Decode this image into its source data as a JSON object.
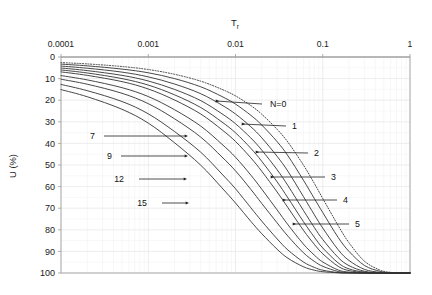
{
  "chart_data": {
    "type": "line",
    "title": "",
    "xlabel": "T_r",
    "xlabel_display": "T",
    "xlabel_sub": "r",
    "ylabel": "U (%)",
    "xscale": "log",
    "xlim": [
      0.0001,
      1
    ],
    "ylim": [
      0,
      100
    ],
    "y_inverted": true,
    "xticks": [
      0.0001,
      0.001,
      0.01,
      0.1,
      1
    ],
    "xticklabels": [
      "0.0001",
      "0.001",
      "0.01",
      "0.1",
      "1"
    ],
    "yticks": [
      0,
      10,
      20,
      30,
      40,
      50,
      60,
      70,
      80,
      90,
      100
    ],
    "yticklabels": [
      "0",
      "10",
      "20",
      "30",
      "40",
      "50",
      "60",
      "70",
      "80",
      "90",
      "100"
    ],
    "grid": true,
    "grid_minor": true,
    "legend": "none",
    "series": [
      {
        "name": "N=0",
        "style": "dotted",
        "x": [
          0.0001,
          0.0002,
          0.0005,
          0.001,
          0.002,
          0.004,
          0.007,
          0.01,
          0.015,
          0.02,
          0.03,
          0.04,
          0.06,
          0.08,
          0.1,
          0.15,
          0.2,
          0.3,
          0.45,
          0.6,
          0.8,
          1.0
        ],
        "y": [
          2.6,
          3.2,
          4.4,
          5.8,
          8.0,
          11.2,
          15.0,
          18.0,
          22.5,
          26.5,
          33.5,
          39.5,
          50.0,
          58.5,
          65.5,
          78.0,
          86.0,
          94.5,
          98.6,
          99.7,
          100,
          100
        ]
      },
      {
        "name": "1",
        "style": "solid",
        "x": [
          0.0001,
          0.0002,
          0.0005,
          0.001,
          0.002,
          0.004,
          0.007,
          0.01,
          0.015,
          0.02,
          0.03,
          0.04,
          0.06,
          0.08,
          0.1,
          0.15,
          0.2,
          0.3,
          0.45,
          0.6,
          0.8,
          1.0
        ],
        "y": [
          3.3,
          4.1,
          5.6,
          7.3,
          10.0,
          13.8,
          18.3,
          21.8,
          27.0,
          31.5,
          39.2,
          45.8,
          57.0,
          65.5,
          72.0,
          83.5,
          90.0,
          96.5,
          99.2,
          99.9,
          100,
          100
        ]
      },
      {
        "name": "2",
        "style": "solid",
        "x": [
          0.0001,
          0.0002,
          0.0005,
          0.001,
          0.002,
          0.004,
          0.007,
          0.01,
          0.015,
          0.02,
          0.03,
          0.04,
          0.06,
          0.08,
          0.1,
          0.15,
          0.2,
          0.3,
          0.45,
          0.6,
          0.8,
          1.0
        ],
        "y": [
          4.2,
          5.2,
          7.0,
          9.2,
          12.5,
          17.0,
          22.3,
          26.4,
          32.3,
          37.4,
          46.0,
          53.0,
          64.6,
          73.0,
          79.2,
          89.2,
          94.2,
          98.3,
          99.7,
          100,
          100,
          100
        ]
      },
      {
        "name": "3",
        "style": "solid",
        "x": [
          0.0001,
          0.0002,
          0.0005,
          0.001,
          0.002,
          0.004,
          0.007,
          0.01,
          0.015,
          0.02,
          0.03,
          0.04,
          0.06,
          0.08,
          0.1,
          0.15,
          0.2,
          0.3,
          0.45,
          0.6,
          0.8,
          1.0
        ],
        "y": [
          5.1,
          6.3,
          8.5,
          11.1,
          15.0,
          20.2,
          26.3,
          30.9,
          37.5,
          43.1,
          52.2,
          59.6,
          71.0,
          78.9,
          84.5,
          92.8,
          96.6,
          99.2,
          99.9,
          100,
          100,
          100
        ]
      },
      {
        "name": "4",
        "style": "solid",
        "x": [
          0.0001,
          0.0002,
          0.0005,
          0.001,
          0.002,
          0.004,
          0.007,
          0.01,
          0.015,
          0.02,
          0.03,
          0.04,
          0.06,
          0.08,
          0.1,
          0.15,
          0.2,
          0.3,
          0.45,
          0.6,
          0.8,
          1.0
        ],
        "y": [
          6.0,
          7.4,
          10.0,
          13.0,
          17.5,
          23.4,
          30.1,
          35.1,
          42.3,
          48.3,
          57.8,
          65.3,
          76.2,
          83.4,
          88.4,
          95.3,
          98.1,
          99.6,
          100,
          100,
          100,
          100
        ]
      },
      {
        "name": "5",
        "style": "solid",
        "x": [
          0.0001,
          0.0002,
          0.0005,
          0.001,
          0.002,
          0.004,
          0.007,
          0.01,
          0.015,
          0.02,
          0.03,
          0.04,
          0.06,
          0.08,
          0.1,
          0.15,
          0.2,
          0.3,
          0.45,
          0.6,
          0.8,
          1.0
        ],
        "y": [
          6.9,
          8.5,
          11.4,
          14.8,
          19.9,
          26.4,
          33.7,
          39.1,
          46.7,
          52.9,
          62.5,
          69.8,
          80.2,
          86.7,
          91.1,
          96.9,
          98.9,
          99.8,
          100,
          100,
          100,
          100
        ]
      },
      {
        "name": "7",
        "style": "solid",
        "x": [
          0.0001,
          0.0002,
          0.0005,
          0.001,
          0.002,
          0.004,
          0.007,
          0.01,
          0.015,
          0.02,
          0.03,
          0.04,
          0.06,
          0.08,
          0.1,
          0.15,
          0.2,
          0.3,
          0.45,
          0.6,
          0.8,
          1.0
        ],
        "y": [
          8.6,
          10.6,
          14.2,
          18.3,
          24.4,
          32.0,
          40.4,
          46.4,
          54.7,
          61.2,
          70.8,
          77.7,
          86.6,
          91.7,
          94.9,
          98.6,
          99.6,
          100,
          100,
          100,
          100,
          100
        ]
      },
      {
        "name": "9",
        "style": "solid",
        "x": [
          0.0001,
          0.0002,
          0.0005,
          0.001,
          0.002,
          0.004,
          0.007,
          0.01,
          0.015,
          0.02,
          0.03,
          0.04,
          0.06,
          0.08,
          0.1,
          0.15,
          0.2,
          0.3,
          0.45,
          0.6,
          0.8,
          1.0
        ],
        "y": [
          10.3,
          12.6,
          16.8,
          21.6,
          28.6,
          37.1,
          46.3,
          52.7,
          61.3,
          67.8,
          76.8,
          83.0,
          90.6,
          94.6,
          96.9,
          99.3,
          99.8,
          100,
          100,
          100,
          100,
          100
        ]
      },
      {
        "name": "12",
        "style": "solid",
        "x": [
          0.0001,
          0.0002,
          0.0005,
          0.001,
          0.002,
          0.004,
          0.007,
          0.01,
          0.015,
          0.02,
          0.03,
          0.04,
          0.06,
          0.08,
          0.1,
          0.15,
          0.2,
          0.3,
          0.45,
          0.6,
          0.8,
          1.0
        ],
        "y": [
          12.7,
          15.6,
          20.6,
          26.3,
          34.5,
          44.1,
          54.2,
          61.0,
          69.8,
          76.0,
          84.2,
          89.4,
          94.9,
          97.4,
          98.7,
          99.8,
          100,
          100,
          100,
          100,
          100,
          100
        ]
      },
      {
        "name": "15",
        "style": "solid",
        "x": [
          0.0001,
          0.0002,
          0.0005,
          0.001,
          0.002,
          0.004,
          0.007,
          0.01,
          0.015,
          0.02,
          0.03,
          0.04,
          0.06,
          0.08,
          0.1,
          0.15,
          0.2,
          0.3,
          0.45,
          0.6,
          0.8,
          1.0
        ],
        "y": [
          15.1,
          18.4,
          24.2,
          30.6,
          39.7,
          50.1,
          60.6,
          67.6,
          76.1,
          81.8,
          89.0,
          93.2,
          97.1,
          98.7,
          99.4,
          99.9,
          100,
          100,
          100,
          100,
          100,
          100
        ]
      }
    ],
    "annotations": [
      {
        "id": "n0",
        "text": "N=0",
        "side": "right",
        "label_x": 270,
        "label_y": 104,
        "arrow_from_x": 262,
        "arrow_from_y": 104,
        "arrow_to_x": 216,
        "arrow_to_y": 101
      },
      {
        "id": "n1",
        "text": "1",
        "side": "right",
        "label_x": 292,
        "label_y": 126,
        "arrow_from_x": 286,
        "arrow_from_y": 126,
        "arrow_to_x": 242,
        "arrow_to_y": 124
      },
      {
        "id": "n2",
        "text": "2",
        "side": "right",
        "label_x": 314,
        "label_y": 153,
        "arrow_from_x": 308,
        "arrow_from_y": 153,
        "arrow_to_x": 256,
        "arrow_to_y": 152
      },
      {
        "id": "n3",
        "text": "3",
        "side": "right",
        "label_x": 331,
        "label_y": 177,
        "arrow_from_x": 325,
        "arrow_from_y": 177,
        "arrow_to_x": 271,
        "arrow_to_y": 177
      },
      {
        "id": "n4",
        "text": "4",
        "side": "right",
        "label_x": 343,
        "label_y": 200,
        "arrow_from_x": 337,
        "arrow_from_y": 200,
        "arrow_to_x": 283,
        "arrow_to_y": 200
      },
      {
        "id": "n5",
        "text": "5",
        "side": "right",
        "label_x": 355,
        "label_y": 224,
        "arrow_from_x": 349,
        "arrow_from_y": 224,
        "arrow_to_x": 293,
        "arrow_to_y": 224
      },
      {
        "id": "n7",
        "text": "7",
        "side": "left",
        "label_x": 95,
        "label_y": 136,
        "arrow_from_x": 104,
        "arrow_from_y": 136,
        "arrow_to_x": 185,
        "arrow_to_y": 136
      },
      {
        "id": "n9",
        "text": "9",
        "side": "left",
        "label_x": 112,
        "label_y": 156,
        "arrow_from_x": 121,
        "arrow_from_y": 156,
        "arrow_to_x": 185,
        "arrow_to_y": 156
      },
      {
        "id": "n12",
        "text": "12",
        "side": "left",
        "label_x": 124,
        "label_y": 179,
        "arrow_from_x": 139,
        "arrow_from_y": 179,
        "arrow_to_x": 184,
        "arrow_to_y": 179
      },
      {
        "id": "n15",
        "text": "15",
        "side": "left",
        "label_x": 147,
        "label_y": 203,
        "arrow_from_x": 162,
        "arrow_from_y": 203,
        "arrow_to_x": 186,
        "arrow_to_y": 203
      }
    ],
    "colors": {
      "curve": "#333333",
      "grid": "#e8e8e8",
      "grid_minor": "#f1f1f1",
      "axis": "#8a8a8a",
      "text": "#1a1a1a",
      "background": "#ffffff"
    }
  }
}
